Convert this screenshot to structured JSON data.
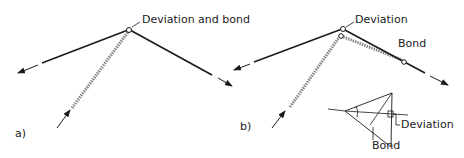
{
  "panel_a": {
    "label": "a)",
    "annotation": "Deviation and bond"
  },
  "panel_b": {
    "label": "b)",
    "annotation_deviation": "Deviation",
    "annotation_bond": "Bond",
    "inset": {
      "deviation": "Deviation",
      "bond": "Bond"
    }
  },
  "colors": {
    "line": "#1a1a1a",
    "hatched": "#9a9a9a"
  }
}
